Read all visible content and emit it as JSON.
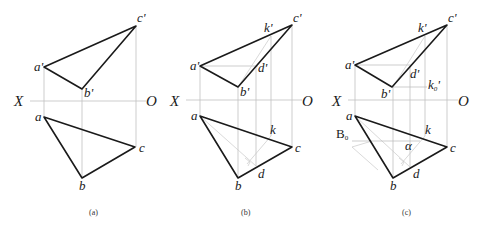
{
  "figure": {
    "panels": [
      {
        "id": "a",
        "caption": "(a)",
        "axis": {
          "x_label": "X",
          "o_label": "O"
        },
        "points": {
          "a_prime": "a'",
          "b_prime": "b'",
          "c_prime": "c'",
          "a": "a",
          "b": "b",
          "c": "c"
        }
      },
      {
        "id": "b",
        "caption": "(b)",
        "axis": {
          "x_label": "X",
          "o_label": "O"
        },
        "points": {
          "a_prime": "a'",
          "b_prime": "b'",
          "c_prime": "c'",
          "k_prime": "k'",
          "d_prime": "d'",
          "a": "a",
          "b": "b",
          "c": "c",
          "k": "k",
          "d": "d"
        }
      },
      {
        "id": "c",
        "caption": "(c)",
        "axis": {
          "x_label": "X",
          "o_label": "O"
        },
        "points": {
          "a_prime": "a'",
          "b_prime": "b'",
          "c_prime": "c'",
          "k_prime": "k'",
          "d_prime": "d'",
          "k0_prime": "k",
          "k0_prime_sub": "0",
          "k0_prime_mark": "'",
          "a": "a",
          "b": "b",
          "c": "c",
          "k": "k",
          "d": "d",
          "B0": "B",
          "B0_sub": "0",
          "alpha": "α"
        }
      }
    ]
  }
}
